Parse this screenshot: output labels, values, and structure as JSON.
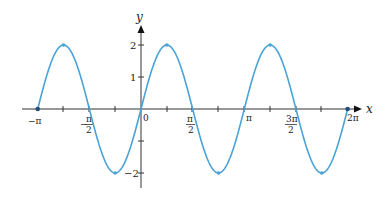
{
  "chart_data": {
    "type": "line",
    "title": "",
    "function": "y = 2 sin(2x)",
    "xlabel": "x",
    "ylabel": "y",
    "xlim": [
      -3.14159,
      6.28319
    ],
    "ylim": [
      -2.5,
      2.5
    ],
    "x_ticks": [
      {
        "value": -3.14159,
        "label": "−π"
      },
      {
        "value": -1.5708,
        "label": "−π/2"
      },
      {
        "value": 0,
        "label": "0"
      },
      {
        "value": 1.5708,
        "label": "π/2"
      },
      {
        "value": 3.14159,
        "label": "π"
      },
      {
        "value": 4.71239,
        "label": "3π/2"
      },
      {
        "value": 6.28319,
        "label": "2π"
      }
    ],
    "y_ticks": [
      {
        "value": 2,
        "label": "2"
      },
      {
        "value": 1,
        "label": "1"
      },
      {
        "value": -1,
        "label": ""
      },
      {
        "value": -2,
        "label": "−2"
      }
    ],
    "series": [
      {
        "name": "y = 2 sin 2x",
        "color": "#4aa3d6",
        "x": [
          -3.14159,
          -2.35619,
          -1.5708,
          -0.7854,
          0,
          0.7854,
          1.5708,
          2.35619,
          3.14159,
          3.92699,
          4.71239,
          5.49779,
          6.28319
        ],
        "values": [
          0,
          2,
          0,
          -2,
          0,
          2,
          0,
          -2,
          0,
          2,
          0,
          -2,
          0
        ]
      }
    ],
    "marked_points": [
      {
        "x": -3.14159,
        "y": 0
      },
      {
        "x": -2.35619,
        "y": 2
      },
      {
        "x": -0.7854,
        "y": -2
      },
      {
        "x": 0.7854,
        "y": 2
      },
      {
        "x": 2.35619,
        "y": -2
      },
      {
        "x": 3.92699,
        "y": 2
      },
      {
        "x": 5.49779,
        "y": -2
      },
      {
        "x": 6.28319,
        "y": 0
      }
    ],
    "grid": false,
    "legend": "none"
  },
  "labels": {
    "x_axis": "x",
    "y_axis": "y",
    "origin": "0",
    "neg_pi": "−π",
    "neg_half_pi_num": "π",
    "neg_half_pi_den": "2",
    "half_pi_num": "π",
    "half_pi_den": "2",
    "pi": "π",
    "three_half_pi_num": "3π",
    "three_half_pi_den": "2",
    "two_pi": "2π",
    "y2": "2",
    "y1": "1",
    "yneg2": "−2"
  },
  "colors": {
    "curve": "#4aa3d6",
    "axis": "#333333"
  }
}
